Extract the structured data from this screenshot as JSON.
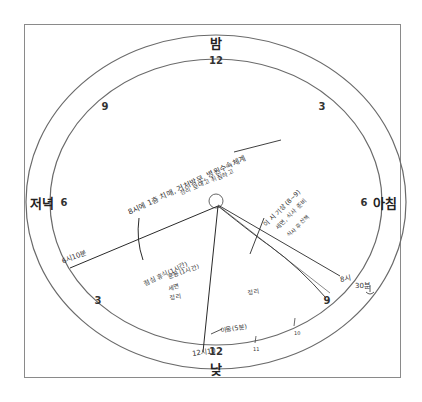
{
  "diagram": {
    "type": "24-hour circular daily schedule",
    "period_labels": {
      "top": "밤",
      "bottom": "낮",
      "left": "저녁",
      "right": "아침"
    },
    "hour_numbers": {
      "top": "12",
      "top_left": "9",
      "top_right": "3",
      "left": "6",
      "right": "6",
      "bottom_left": "3",
      "bottom_right": "9",
      "bottom": "12"
    },
    "handwritten": {
      "evening_line_label": "6시10분",
      "noon_line_label": "12시10",
      "morning_line_label": "8시",
      "morning_note": "30분",
      "night_note_1": "8시에 1층 치매, 거처방문, 병원수속체계",
      "night_note_2": "정리 보내고 취침하고",
      "morning_block_1": "이 시 기상 (8~9)",
      "morning_block_2": "세면, 식사 준비",
      "morning_block_3": "식사 후 산책",
      "afternoon_block_1": "점심 휴식(1시간)",
      "afternoon_block_2": "운동(1시간)",
      "afternoon_block_3": "세면",
      "afternoon_block_4": "정리",
      "late_morning_block": "정리",
      "move_note": "이동(5분)",
      "tick_10": "10",
      "tick_11": "11"
    },
    "accent_colors": {
      "ink": "#2a2a2a",
      "frame": "#8a8a8a",
      "ring": "#6a6a6a"
    }
  }
}
